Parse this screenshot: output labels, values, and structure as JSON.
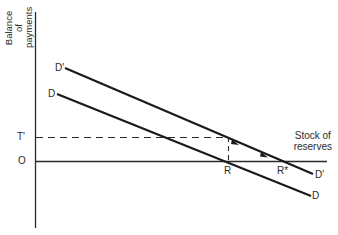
{
  "diagram": {
    "y_axis_label_line1": "Balance of",
    "y_axis_label_line2": "payments",
    "x_axis_label_line1": "Stock of",
    "x_axis_label_line2": "reserves",
    "origin_label": "O",
    "tprime_label": "T'",
    "r_label": "R",
    "rstar_label": "R*",
    "curve_d_label_start": "D",
    "curve_d_label_end": "D",
    "curve_dprime_label_start": "D'",
    "curve_dprime_label_end": "D'",
    "colors": {
      "line": "#1a1a1a",
      "background": "#ffffff"
    }
  }
}
